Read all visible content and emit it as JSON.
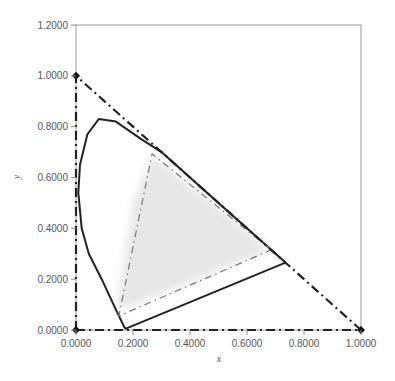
{
  "chart_data": {
    "type": "line",
    "title": "",
    "xlabel": "x",
    "ylabel": "y",
    "xlim": [
      0,
      1.0
    ],
    "ylim": [
      0,
      1.2
    ],
    "grid": false,
    "legend": null,
    "x_ticks": [
      "0.0000",
      "0.2000",
      "0.4000",
      "0.6000",
      "0.8000",
      "1.0000"
    ],
    "y_ticks": [
      "0.0000",
      "0.2000",
      "0.4000",
      "0.6000",
      "0.8000",
      "1.0000",
      "1.2000"
    ],
    "x_tick_values": [
      0,
      0.2,
      0.4,
      0.6,
      0.8,
      1.0
    ],
    "y_tick_values": [
      0,
      0.2,
      0.4,
      0.6,
      0.8,
      1.0,
      1.2
    ],
    "series": [
      {
        "name": "spectral locus",
        "style": "solid",
        "color": "#222222",
        "points": [
          [
            0.735,
            0.265
          ],
          [
            0.6,
            0.4
          ],
          [
            0.5,
            0.5
          ],
          [
            0.4,
            0.6
          ],
          [
            0.3,
            0.7
          ],
          [
            0.23,
            0.75
          ],
          [
            0.14,
            0.82
          ],
          [
            0.08,
            0.83
          ],
          [
            0.04,
            0.77
          ],
          [
            0.014,
            0.65
          ],
          [
            0.008,
            0.54
          ],
          [
            0.02,
            0.4
          ],
          [
            0.045,
            0.3
          ],
          [
            0.09,
            0.2
          ],
          [
            0.14,
            0.08
          ],
          [
            0.17,
            0.01
          ],
          [
            0.175,
            0.005
          ],
          [
            0.735,
            0.265
          ]
        ]
      },
      {
        "name": "display gamut triangle",
        "style": "dash-dot",
        "color": "#777777",
        "points": [
          [
            0.685,
            0.315
          ],
          [
            0.267,
            0.693
          ],
          [
            0.15,
            0.055
          ],
          [
            0.685,
            0.315
          ]
        ]
      },
      {
        "name": "unit triangle",
        "style": "dash-dot",
        "color": "#222222",
        "points": [
          [
            0,
            0
          ],
          [
            1,
            0
          ],
          [
            0,
            1
          ],
          [
            0,
            0
          ]
        ],
        "markers": [
          [
            0,
            0
          ],
          [
            1,
            0
          ],
          [
            0,
            1
          ]
        ]
      }
    ],
    "scatter_region": {
      "name": "sample chromaticities",
      "color": "#e6e6e6",
      "polygon": [
        [
          0.14,
          0.07
        ],
        [
          0.2,
          0.5
        ],
        [
          0.267,
          0.69
        ],
        [
          0.685,
          0.315
        ]
      ]
    }
  }
}
